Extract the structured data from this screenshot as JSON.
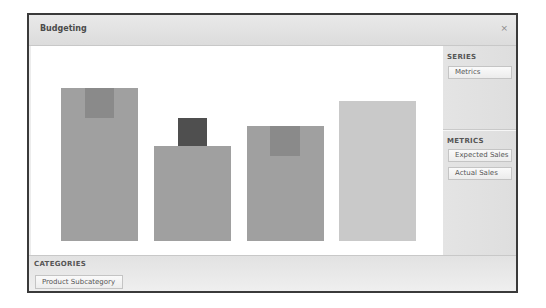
{
  "window": {
    "title": "Budgeting",
    "close_glyph": "×"
  },
  "side_panel": {
    "series": {
      "label": "SERIES",
      "items": [
        "Metrics"
      ]
    },
    "metrics": {
      "label": "METRICS",
      "items": [
        "Expected Sales",
        "Actual Sales"
      ]
    }
  },
  "categories": {
    "label": "CATEGORIES",
    "items": [
      "Product Subcategory"
    ]
  },
  "colors": {
    "bar": "#a0a0a0",
    "bar_light": "#c9c9c9",
    "marker": "#8a8a8a",
    "marker_dark": "#4f4f4f"
  },
  "chart_data": {
    "type": "bar",
    "title": "",
    "xlabel": "Product Subcategory",
    "ylabel": "",
    "categories": [
      "",
      "",
      "",
      ""
    ],
    "series": [
      {
        "name": "Expected Sales",
        "values": [
          153,
          95,
          115,
          140
        ]
      },
      {
        "name": "Actual Sales",
        "values": [
          153,
          123,
          115,
          null
        ]
      }
    ],
    "marker_heights": [
      30,
      28,
      30,
      0
    ],
    "grid": false,
    "legend": "none",
    "bars_px": [
      {
        "left": 30,
        "top": 42,
        "width": 77,
        "height": 153,
        "color": "#a0a0a0",
        "marker": {
          "left": 24,
          "top": 0,
          "width": 29,
          "height": 30,
          "color": "#8a8a8a"
        }
      },
      {
        "left": 123,
        "top": 100,
        "width": 77,
        "height": 95,
        "color": "#a0a0a0",
        "marker": {
          "left": 24,
          "top": -28,
          "width": 29,
          "height": 28,
          "color": "#4f4f4f"
        }
      },
      {
        "left": 216,
        "top": 80,
        "width": 77,
        "height": 115,
        "color": "#a0a0a0",
        "marker": {
          "left": 23,
          "top": 0,
          "width": 30,
          "height": 30,
          "color": "#8a8a8a"
        }
      },
      {
        "left": 308,
        "top": 55,
        "width": 77,
        "height": 140,
        "color": "#c9c9c9",
        "marker": null
      }
    ]
  }
}
